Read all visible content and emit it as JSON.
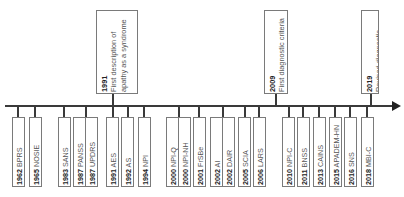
{
  "timeline": {
    "direction": "left-to-right",
    "bottom_items": [
      {
        "year": "1962",
        "label": "BPRS"
      },
      {
        "year": "1965",
        "label": "NOSIE"
      },
      {
        "year": "1983",
        "label": "SANS"
      },
      {
        "year": "1987",
        "label": "PANSS"
      },
      {
        "year": "1987",
        "label": "UPDRS"
      },
      {
        "year": "1991",
        "label": "AES"
      },
      {
        "year": "1992",
        "label": "AS"
      },
      {
        "year": "1994",
        "label": "NPI"
      },
      {
        "year": "2000",
        "label": "NPI-Q"
      },
      {
        "year": "2000",
        "label": "NPI-NH"
      },
      {
        "year": "2001",
        "label": "FrSBe"
      },
      {
        "year": "2002",
        "label": "AI"
      },
      {
        "year": "2002",
        "label": "DAIR"
      },
      {
        "year": "2005",
        "label": "SCIA"
      },
      {
        "year": "2006",
        "label": "LARS"
      },
      {
        "year": "2010",
        "label": "NPI-C"
      },
      {
        "year": "2011",
        "label": "BNSS"
      },
      {
        "year": "2013",
        "label": "CAINS"
      },
      {
        "year": "2015",
        "label": "APADEM-HN"
      },
      {
        "year": "2016",
        "label": "SNS"
      },
      {
        "year": "2018",
        "label": "MBI-C"
      }
    ],
    "top_items": [
      {
        "year": "1991",
        "lines": [
          "First description of",
          "apathy as a syndrome"
        ]
      },
      {
        "year": "2009",
        "lines": [
          "First diagnostic criteria"
        ]
      },
      {
        "year": "2019",
        "lines": [
          "Revised diagnostic",
          "criteria"
        ]
      }
    ]
  }
}
